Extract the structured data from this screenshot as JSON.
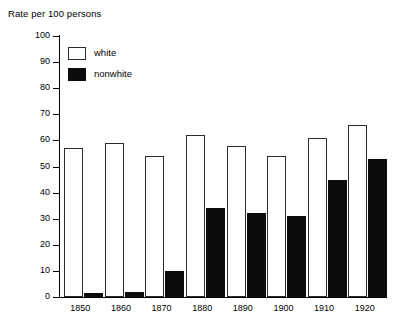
{
  "chart_data": {
    "type": "bar",
    "title": "Rate per 100 persons",
    "xlabel": "",
    "ylabel": "Rate per 100 persons",
    "ylim": [
      0,
      100
    ],
    "ytick_values": [
      0,
      10,
      20,
      30,
      40,
      50,
      60,
      70,
      80,
      90,
      100
    ],
    "ytick_labels": [
      "0",
      "10",
      "20",
      "30",
      "40",
      "50",
      "60",
      "70",
      "80",
      "90",
      "100"
    ],
    "grid": false,
    "legend_position": "top-left",
    "categories": [
      "1850",
      "1860",
      "1870",
      "1880",
      "1890",
      "1900",
      "1910",
      "1920"
    ],
    "series": [
      {
        "name": "white",
        "color": "#ffffff",
        "edge_color": "#2b2b2b",
        "values": [
          57,
          59,
          54,
          62,
          58,
          54,
          61,
          66
        ]
      },
      {
        "name": "nonwhite",
        "color": "#0c0c0c",
        "edge_color": "#0c0c0c",
        "values": [
          1.5,
          2,
          10,
          34,
          32,
          31,
          45,
          53
        ]
      }
    ]
  },
  "legend": {
    "entries": [
      {
        "label": "white",
        "swatch": "open-square-swatch"
      },
      {
        "label": "nonwhite",
        "swatch": "filled-square-swatch"
      }
    ]
  }
}
